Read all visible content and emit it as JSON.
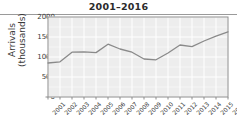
{
  "chart_data": {
    "type": "line",
    "title": "2001–2016",
    "xlabel": "",
    "ylabel": "Arrivals (thousands)",
    "ylabel_line1": "Arrivals",
    "ylabel_line2": "(thousands)",
    "categories": [
      "2001",
      "2002",
      "2003",
      "2004",
      "2005",
      "2006",
      "2007",
      "2008",
      "2009",
      "2010",
      "2011",
      "2012",
      "2013",
      "2014",
      "2015",
      "2016"
    ],
    "values": [
      850,
      880,
      1120,
      1130,
      1110,
      1320,
      1200,
      1120,
      950,
      930,
      1100,
      1300,
      1260,
      1400,
      1520,
      1630
    ],
    "series": [
      {
        "name": "Arrivals",
        "values": [
          850,
          880,
          1120,
          1130,
          1110,
          1320,
          1200,
          1120,
          950,
          930,
          1100,
          1300,
          1260,
          1400,
          1520,
          1630
        ]
      }
    ],
    "ylim": [
      0,
      2000
    ],
    "yticks": [
      0,
      500,
      1000,
      1500,
      2000
    ],
    "ytick_labels": [
      "0",
      "500",
      "1000",
      "1500",
      "2000"
    ],
    "grid": true,
    "legend": false,
    "line_color": "#8a8a8a",
    "grid_color": "#ffffff",
    "plot_background": "#ededed",
    "axis_color": "#8d8d8d",
    "text_color": "#3a3a3a",
    "title_color": "#2b2b2b"
  }
}
